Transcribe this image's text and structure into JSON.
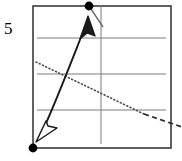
{
  "figure": {
    "title": "",
    "axis_label_left": "5",
    "background_color": "#ffffff",
    "frame": {
      "name": "plot-frame",
      "x": 33,
      "y": 6,
      "width": 138,
      "height": 142,
      "stroke_color": "#3b3b3b",
      "stroke_width": 1.6
    },
    "gridlines": {
      "color": "#7a7a7a",
      "stroke_width": 1,
      "x_start": 37,
      "x_end": 166,
      "y_values": [
        38,
        74,
        110
      ]
    },
    "vertical_axis": {
      "name": "vertical-axis-line",
      "x": 101,
      "y_top": 6,
      "y_bottom": 144,
      "color": "#7a7a7a",
      "stroke_width": 1
    },
    "markers": [
      {
        "name": "endpoint-dot-top",
        "x": 89,
        "y": 6,
        "radius": 4.4,
        "fill": "#000000"
      },
      {
        "name": "endpoint-dot-bottom",
        "x": 33,
        "y": 148,
        "radius": 4.4,
        "fill": "#000000"
      }
    ],
    "curves": [
      {
        "name": "solid-double-arrow-curve",
        "style": "solid",
        "color": "#1a1a1a",
        "stroke_width": 1.9,
        "path": "M 41 134 C 52 112, 68 70, 87 22",
        "arrow_head_start": "open-triangle-down-left",
        "arrow_head_end": "filled-arrow-up-right"
      },
      {
        "name": "dotted-descending-line",
        "style": "dotted",
        "color": "#4a4a4a",
        "stroke_width": 1.6,
        "dash_pattern": "1 2.6",
        "x1": 36,
        "y1": 62,
        "x2": 144,
        "y2": 114
      },
      {
        "name": "dashed-descending-line-extension",
        "style": "dashed",
        "color": "#2a2a2a",
        "stroke_width": 1.8,
        "dash_pattern": "5 3.5",
        "x1": 144,
        "y1": 114,
        "x2": 182,
        "y2": 127
      },
      {
        "name": "top-tick-stroke",
        "style": "solid",
        "color": "#6a6a6a",
        "stroke_width": 1.4,
        "x1": 91,
        "y1": 9,
        "x2": 103,
        "y2": 27
      }
    ],
    "arrowheads": [
      {
        "name": "arrowhead-open-bottom-left",
        "fill": "#ffffff",
        "stroke": "#1a1a1a",
        "stroke_width": 1.5,
        "points": "38 140 56 127 47 126 45 123"
      },
      {
        "name": "arrowhead-filled-top-right",
        "fill": "#1a1a1a",
        "stroke": "#1a1a1a",
        "stroke_width": 1.4,
        "points": "88 17 81 38 87 33 94 36"
      }
    ]
  }
}
